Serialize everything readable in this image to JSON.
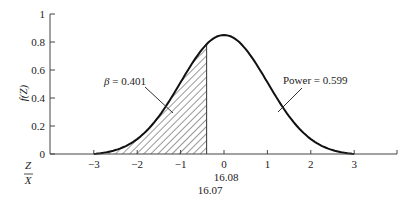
{
  "chart_data": {
    "type": "area",
    "title": "",
    "xlabel": "Z",
    "xlabel2": "X̄",
    "ylabel": "f(Z)",
    "xlim": [
      -3,
      3
    ],
    "ylim": [
      0,
      1
    ],
    "x_ticks": [
      "−3",
      "−2",
      "−1",
      "0",
      "1",
      "2",
      "3"
    ],
    "y_ticks": [
      "0",
      "0.2",
      "0.4",
      "0.6",
      "0.8",
      "1"
    ],
    "xbar_labels": [
      "16.08",
      "16.07"
    ],
    "curve": {
      "description": "Bell-shaped density curve, peak ≈ 0.85 at Z = 0, zero at Z = ±3",
      "peak": 0.85,
      "shaded_from": -3,
      "shaded_to": -0.4
    },
    "annotations": [
      {
        "label_symbol": "β",
        "label_rest": " = 0.401",
        "target": "shaded region (left)"
      },
      {
        "label": "Power = 0.599",
        "target": "unshaded region (right)"
      }
    ],
    "colors": {
      "line": "#111111",
      "axis": "#444444",
      "hatch": "#333333"
    }
  }
}
